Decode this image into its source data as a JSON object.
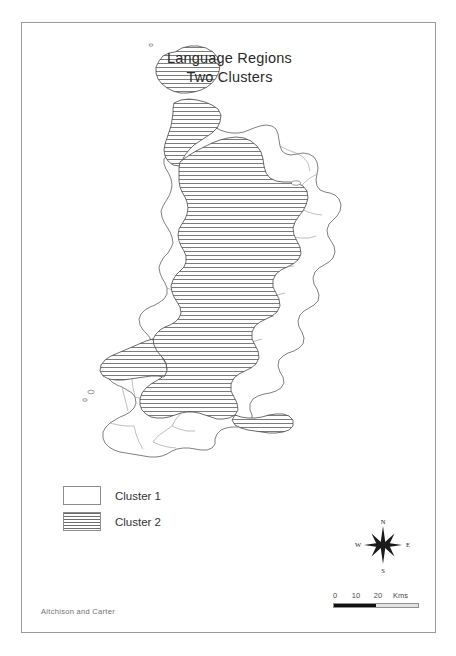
{
  "figure": {
    "title_lines": [
      "Language Regions",
      "Two Clusters"
    ],
    "attribution": "Aitchison and Carter",
    "frame_color": "#9a9a9a",
    "background_color": "#ffffff"
  },
  "legend": {
    "items": [
      {
        "label": "Cluster 1",
        "fill": "none",
        "swatch_color": "#ffffff"
      },
      {
        "label": "Cluster 2",
        "fill": "hatched",
        "swatch_color": "#6d6d6d"
      }
    ]
  },
  "compass": {
    "north": "N",
    "east": "E",
    "south": "S",
    "west": "W"
  },
  "scale": {
    "ticks": [
      "0",
      "10",
      "20"
    ],
    "units": "Kms",
    "segments": [
      "filled",
      "empty"
    ]
  },
  "map": {
    "region_name": "Wales",
    "outline_color": "#4a4a4a",
    "boundary_color": "#777777",
    "hatch_color": "#6d6d6d",
    "clusters": [
      {
        "name": "Cluster 1",
        "description": "Unhatched areas: Pembrokeshire, south coast, south-east and eastern border districts"
      },
      {
        "name": "Cluster 2",
        "description": "Horizontally hatched areas: Anglesey, north-west, Llyn peninsula, mid and west Wales"
      }
    ]
  }
}
